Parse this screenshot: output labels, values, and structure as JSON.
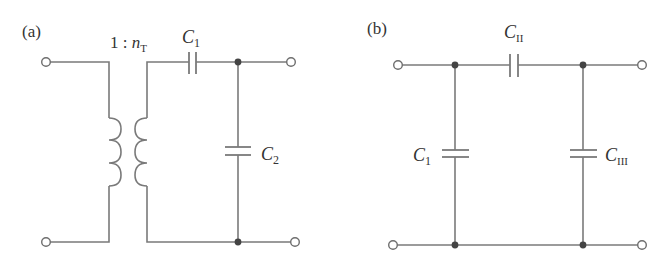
{
  "figure": {
    "panels": [
      {
        "id": "a",
        "label": "(a)",
        "transformer": {
          "ratio_prefix": "1 : ",
          "ratio_var": "n",
          "ratio_sub": "T"
        },
        "components": [
          {
            "type": "transformer",
            "ratio": "1 : n_T"
          },
          {
            "type": "capacitor",
            "name": "C",
            "sub": "1",
            "placement": "series"
          },
          {
            "type": "capacitor",
            "name": "C",
            "sub": "2",
            "placement": "shunt"
          }
        ],
        "terminals": 4
      },
      {
        "id": "b",
        "label": "(b)",
        "components": [
          {
            "type": "capacitor",
            "name": "C",
            "sub": "1",
            "placement": "shunt-left"
          },
          {
            "type": "capacitor",
            "name": "C",
            "sub": "II",
            "placement": "series"
          },
          {
            "type": "capacitor",
            "name": "C",
            "sub": "III",
            "placement": "shunt-right"
          }
        ],
        "terminals": 4
      }
    ],
    "colors": {
      "wire": "#7a7a7a",
      "node": "#444444",
      "text": "#333333",
      "background": "#ffffff"
    }
  }
}
